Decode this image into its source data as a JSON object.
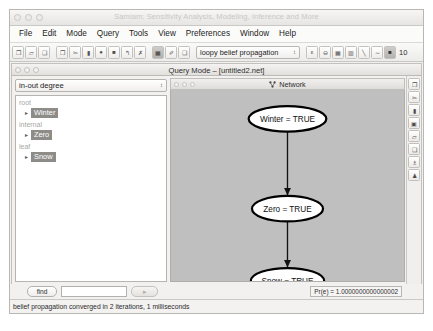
{
  "window": {
    "title": "Samiam: Sensitivity Analysis, Modeling, Inference and More",
    "traffic_lights": [
      "close-dot",
      "minimize-dot",
      "zoom-dot"
    ]
  },
  "menubar": {
    "items": [
      {
        "label": "File"
      },
      {
        "label": "Edit"
      },
      {
        "label": "Mode"
      },
      {
        "label": "Query"
      },
      {
        "label": "Tools"
      },
      {
        "label": "View"
      },
      {
        "label": "Preferences"
      },
      {
        "label": "Window"
      },
      {
        "label": "Help"
      }
    ]
  },
  "toolbar": {
    "group1": [
      {
        "name": "new-file-icon",
        "glyph": "❐"
      },
      {
        "name": "open-folder-icon",
        "glyph": "▱"
      },
      {
        "name": "save-icon",
        "glyph": "❑"
      }
    ],
    "group2": [
      {
        "name": "copy-icon",
        "glyph": "❐"
      },
      {
        "name": "cut-scissors-icon",
        "glyph": "✂"
      },
      {
        "name": "node-chance-icon",
        "glyph": "▮"
      },
      {
        "name": "node-circle-icon",
        "glyph": "●"
      },
      {
        "name": "node-square-icon",
        "glyph": "■"
      },
      {
        "name": "undo-arrow-icon",
        "glyph": "↰"
      },
      {
        "name": "redo-arrow-icon",
        "glyph": "✗"
      }
    ],
    "group3": [
      {
        "name": "monitor-icon",
        "glyph": "▦",
        "state": "dark"
      },
      {
        "name": "edit-table-icon",
        "glyph": "✐"
      },
      {
        "name": "clipboard-icon",
        "glyph": "❑"
      }
    ],
    "algorithm_select": {
      "value": "loopy belief propagation",
      "arrow": "↕"
    },
    "group4": [
      {
        "name": "evidence-icon",
        "glyph": "ε"
      },
      {
        "name": "minus-circle-icon",
        "glyph": "⊖"
      },
      {
        "name": "grid-table-icon",
        "glyph": "▦"
      },
      {
        "name": "grid-bars-icon",
        "glyph": "▥"
      },
      {
        "name": "sensitivity-icon",
        "glyph": "╲"
      },
      {
        "name": "link-icon",
        "glyph": "∼"
      },
      {
        "name": "screen-icon",
        "glyph": "■",
        "state": "dark"
      }
    ],
    "zoom_value": "10"
  },
  "document_window": {
    "title": "Query Mode – [untitled2.net]",
    "traffic_lights": [
      "close-dot",
      "minimize-dot",
      "zoom-dot"
    ]
  },
  "left_panel": {
    "layout_select": {
      "value": "in-out degree",
      "arrow": "↕"
    },
    "tree": [
      {
        "group_label": "root",
        "nodes": [
          {
            "label": "Winter",
            "disc": "▸"
          }
        ]
      },
      {
        "group_label": "internal",
        "nodes": [
          {
            "label": "Zero",
            "disc": "▸"
          }
        ]
      },
      {
        "group_label": "leaf",
        "nodes": [
          {
            "label": "Snow",
            "disc": "▸"
          }
        ]
      }
    ]
  },
  "network_panel": {
    "title": "Network",
    "icon": "network-graph-icon",
    "traffic_lights": [
      "close-dot",
      "minimize-dot",
      "zoom-dot"
    ],
    "background_color": "#bfbfbf",
    "nodes": [
      {
        "id": "winter",
        "label": "Winter = TRUE",
        "cx": 105,
        "cy": 26
      },
      {
        "id": "zero",
        "label": "Zero = TRUE",
        "cx": 105,
        "cy": 108
      },
      {
        "id": "snow",
        "label": "Snow = TRUE",
        "cx": 105,
        "cy": 173
      }
    ],
    "edges": [
      {
        "from": "winter",
        "to": "zero"
      },
      {
        "from": "zero",
        "to": "snow"
      }
    ]
  },
  "side_toolbar": {
    "buttons": [
      {
        "name": "select-pointer-icon",
        "glyph": "❐"
      },
      {
        "name": "cut-scissors-icon",
        "glyph": "✂"
      },
      {
        "name": "delete-node-icon",
        "glyph": "▮"
      },
      {
        "name": "monitor-panel-icon",
        "glyph": "▣"
      },
      {
        "name": "label-tag-icon",
        "glyph": "▱"
      },
      {
        "name": "properties-icon",
        "glyph": "❑"
      },
      {
        "name": "probability-icon",
        "glyph": "♗"
      },
      {
        "name": "evidence-pin-icon",
        "glyph": "♟"
      }
    ]
  },
  "find_row": {
    "find_label": "find",
    "search_value": "",
    "search_placeholder": "",
    "next_label": "▸",
    "pr_evidence": "Pr(e) = 1.0000000000000002"
  },
  "statusbar": {
    "message": "belief propagation converged in 2 iterations, 1 milliseconds"
  }
}
